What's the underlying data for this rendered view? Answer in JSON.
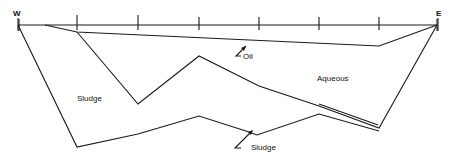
{
  "diagram": {
    "title": "",
    "directions": {
      "west": "W",
      "east": "E"
    },
    "regions": {
      "oil": "Oil",
      "aqueous": "Aqueous",
      "sludge_left": "Sludge",
      "sludge_bottom": "Sludge"
    },
    "surface_ticks_x": [
      19,
      77,
      138,
      199,
      259,
      319,
      379,
      437
    ],
    "colors": {
      "line": "#1a1a1a",
      "background": "#ffffff"
    }
  }
}
